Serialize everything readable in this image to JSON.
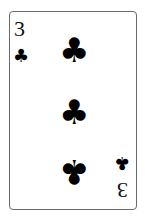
{
  "card": {
    "rank": "3",
    "suit": "clubs",
    "suit_glyph": "♣",
    "color": "#000000"
  }
}
